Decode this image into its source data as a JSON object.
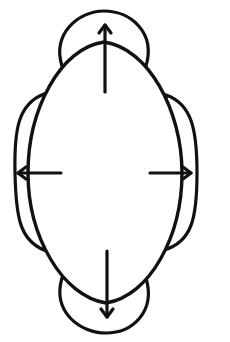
{
  "diagram": {
    "type": "line-drawing",
    "colors": {
      "stroke": "#111111",
      "background": "#ffffff"
    },
    "main_shape": {
      "label": ""
    },
    "lobes": [
      {
        "position": "top",
        "label": ""
      },
      {
        "position": "bottom",
        "label": ""
      },
      {
        "position": "left",
        "label": ""
      },
      {
        "position": "right",
        "label": ""
      }
    ],
    "arrows": [
      {
        "direction": "up",
        "label": ""
      },
      {
        "direction": "down",
        "label": ""
      },
      {
        "direction": "left",
        "label": ""
      },
      {
        "direction": "right",
        "label": ""
      }
    ]
  }
}
